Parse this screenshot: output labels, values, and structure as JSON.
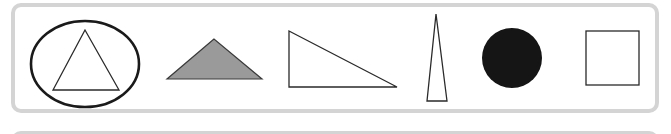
{
  "figure": {
    "colors": {
      "frame": "#d4d4d4",
      "stroke": "#222222",
      "gray_fill": "#999999",
      "black_fill": "#111111"
    },
    "shapes": [
      {
        "name": "ellipse-with-triangle",
        "type": "ellipse containing equilateral triangle",
        "fill": "none"
      },
      {
        "name": "gray-obtuse-triangle",
        "type": "obtuse isosceles triangle",
        "fill": "gray"
      },
      {
        "name": "right-triangle",
        "type": "right triangle",
        "fill": "none"
      },
      {
        "name": "tall-isosceles-triangle",
        "type": "narrow isosceles triangle",
        "fill": "none"
      },
      {
        "name": "black-circle",
        "type": "circle",
        "fill": "black"
      },
      {
        "name": "square",
        "type": "square",
        "fill": "none"
      }
    ]
  }
}
